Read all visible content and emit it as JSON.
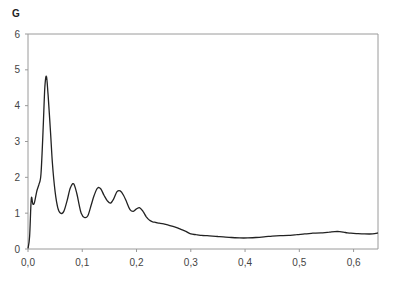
{
  "chart_data": {
    "type": "line",
    "title": "",
    "ylabel": "G",
    "xlabel": "",
    "xlim": [
      0,
      0.645
    ],
    "ylim": [
      0,
      6
    ],
    "grid": false,
    "legend": null,
    "x_ticks": [
      "0,0",
      "0,1",
      "0,2",
      "0,3",
      "0,4",
      "0,5",
      "0,6"
    ],
    "x_tick_values": [
      0,
      0.1,
      0.2,
      0.3,
      0.4,
      0.5,
      0.6
    ],
    "y_ticks": [
      "0",
      "1",
      "2",
      "3",
      "4",
      "5",
      "6"
    ],
    "y_tick_values": [
      0,
      1,
      2,
      3,
      4,
      5,
      6
    ],
    "series": [
      {
        "name": "G",
        "color": "#222222",
        "x": [
          0.0,
          0.003,
          0.006,
          0.009,
          0.012,
          0.016,
          0.02,
          0.024,
          0.028,
          0.031,
          0.034,
          0.037,
          0.041,
          0.045,
          0.05,
          0.055,
          0.06,
          0.066,
          0.072,
          0.078,
          0.084,
          0.09,
          0.094,
          0.098,
          0.104,
          0.11,
          0.116,
          0.122,
          0.128,
          0.134,
          0.14,
          0.146,
          0.152,
          0.158,
          0.164,
          0.17,
          0.176,
          0.182,
          0.188,
          0.194,
          0.2,
          0.206,
          0.212,
          0.218,
          0.224,
          0.23,
          0.236,
          0.242,
          0.25,
          0.26,
          0.27,
          0.28,
          0.29,
          0.3,
          0.31,
          0.32,
          0.33,
          0.34,
          0.35,
          0.36,
          0.375,
          0.39,
          0.405,
          0.42,
          0.435,
          0.45,
          0.465,
          0.48,
          0.495,
          0.51,
          0.525,
          0.54,
          0.555,
          0.57,
          0.585,
          0.595,
          0.605,
          0.62,
          0.635,
          0.645
        ],
        "y": [
          0.02,
          0.35,
          1.4,
          1.25,
          1.3,
          1.6,
          1.8,
          2.1,
          3.4,
          4.5,
          4.82,
          4.3,
          3.4,
          2.4,
          1.6,
          1.15,
          1.0,
          1.05,
          1.35,
          1.7,
          1.82,
          1.55,
          1.25,
          1.0,
          0.88,
          0.92,
          1.2,
          1.5,
          1.7,
          1.68,
          1.5,
          1.35,
          1.28,
          1.4,
          1.6,
          1.62,
          1.5,
          1.3,
          1.1,
          1.05,
          1.12,
          1.15,
          1.05,
          0.9,
          0.8,
          0.76,
          0.74,
          0.72,
          0.7,
          0.66,
          0.62,
          0.56,
          0.5,
          0.42,
          0.4,
          0.38,
          0.37,
          0.36,
          0.35,
          0.34,
          0.32,
          0.31,
          0.31,
          0.32,
          0.34,
          0.36,
          0.37,
          0.38,
          0.4,
          0.42,
          0.44,
          0.45,
          0.47,
          0.49,
          0.46,
          0.44,
          0.43,
          0.42,
          0.42,
          0.45
        ]
      }
    ]
  }
}
